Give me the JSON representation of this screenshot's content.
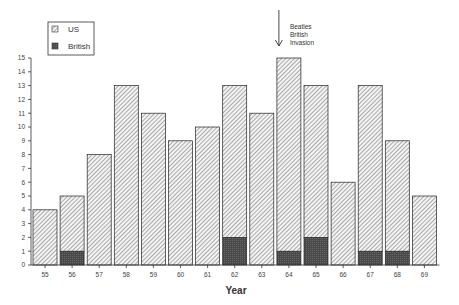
{
  "chart_data": {
    "type": "bar",
    "stacked": true,
    "title": "",
    "xlabel": "Year",
    "ylabel": "",
    "ylim": [
      0,
      15
    ],
    "yticks": [
      0,
      1,
      2,
      3,
      4,
      5,
      6,
      7,
      8,
      9,
      10,
      11,
      12,
      13,
      14,
      15
    ],
    "categories": [
      "55",
      "56",
      "57",
      "58",
      "59",
      "60",
      "61",
      "62",
      "63",
      "64",
      "65",
      "66",
      "67",
      "68",
      "69"
    ],
    "series": [
      {
        "name": "British",
        "pattern": "solid-dark",
        "color": "#555555",
        "values": [
          0,
          1,
          0,
          0,
          0,
          0,
          0,
          2,
          0,
          1,
          2,
          0,
          1,
          1,
          0
        ]
      },
      {
        "name": "US",
        "pattern": "hatched",
        "color": "#888888",
        "values": [
          4,
          4,
          8,
          13,
          11,
          9,
          10,
          11,
          11,
          14,
          11,
          6,
          12,
          8,
          5
        ]
      }
    ],
    "totals": [
      4,
      5,
      8,
      13,
      11,
      9,
      10,
      13,
      11,
      15,
      13,
      6,
      13,
      9,
      5
    ],
    "legend": {
      "position": "top-left",
      "entries": [
        "US",
        "British"
      ]
    },
    "annotation": {
      "text_lines": [
        "Beatles",
        "British",
        "Invasion"
      ],
      "category": "64"
    },
    "grid": false
  }
}
